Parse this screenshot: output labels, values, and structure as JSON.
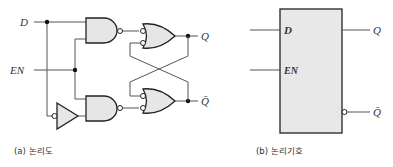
{
  "figure": {
    "logic_diagram": {
      "caption": "(a) 논리도",
      "inputs": [
        {
          "label": "D"
        },
        {
          "label": "EN"
        }
      ],
      "outputs": [
        {
          "label": "Q"
        },
        {
          "label": "Q̄"
        }
      ],
      "gates": [
        "AND (top, inverted output)",
        "AND (bottom, inverted output)",
        "NOT (inverter on D)",
        "OR with inverted inputs (top)",
        "OR with inverted inputs (bottom)"
      ]
    },
    "logic_symbol": {
      "caption": "(b) 논리기호",
      "inputs": [
        {
          "label": "D"
        },
        {
          "label": "EN"
        }
      ],
      "outputs": [
        {
          "label": "Q"
        },
        {
          "label": "Q̄"
        }
      ]
    }
  },
  "colors": {
    "gate_fill": "#e6e6e6",
    "box_fill": "#e8e8e8",
    "stroke": "#222222"
  }
}
